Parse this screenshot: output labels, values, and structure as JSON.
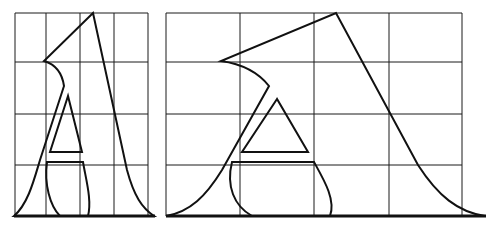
{
  "figure": {
    "stroke_color": "#111111",
    "grid_color": "#1a1a1a",
    "background": "#ffffff"
  },
  "panels": [
    {
      "name": "narrow-letter-a",
      "grid": {
        "columns": 4,
        "rows": 4,
        "x": [
          15,
          46,
          80,
          114,
          148
        ],
        "y": [
          13,
          62,
          114,
          165,
          216
        ]
      }
    },
    {
      "name": "wide-letter-a",
      "grid": {
        "columns": 4,
        "rows": 4,
        "x": [
          166,
          240,
          314,
          389,
          462
        ],
        "y": [
          13,
          62,
          114,
          165,
          216
        ]
      }
    }
  ]
}
